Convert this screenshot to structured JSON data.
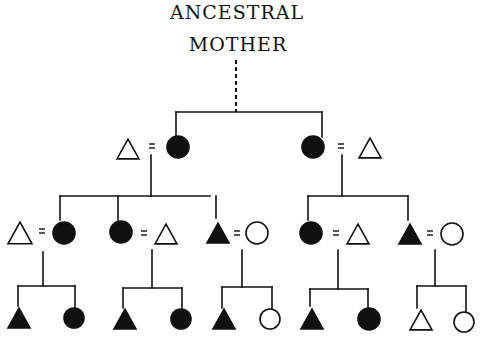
{
  "title": {
    "line1": "ANCESTRAL",
    "line2": "MOTHER"
  },
  "colors": {
    "ink": "#111111",
    "paper": "#ffffff"
  },
  "legend": {
    "triangle": "male",
    "circle": "female",
    "filled": "member of matrilineage",
    "open": "not a member of matrilineage",
    "equals": "marriage",
    "dashed": "descent from ancestral mother"
  },
  "descent_line": {
    "x": 236,
    "y1": 60,
    "y2": 112,
    "dashed": true
  },
  "lines": [
    [
      176,
      112,
      322,
      112
    ],
    [
      176,
      112,
      176,
      137
    ],
    [
      322,
      112,
      322,
      137
    ],
    [
      151,
      155,
      151,
      196
    ],
    [
      60,
      196,
      210,
      196
    ],
    [
      60,
      196,
      60,
      220
    ],
    [
      118,
      196,
      118,
      220
    ],
    [
      216,
      196,
      216,
      218
    ],
    [
      342,
      155,
      342,
      196
    ],
    [
      308,
      196,
      408,
      196
    ],
    [
      308,
      196,
      308,
      220
    ],
    [
      408,
      196,
      408,
      220
    ],
    [
      43,
      252,
      43,
      286
    ],
    [
      18,
      286,
      75,
      286
    ],
    [
      18,
      286,
      18,
      306
    ],
    [
      75,
      286,
      75,
      308
    ],
    [
      152,
      250,
      152,
      288
    ],
    [
      123,
      288,
      182,
      288
    ],
    [
      123,
      288,
      123,
      308
    ],
    [
      182,
      288,
      182,
      308
    ],
    [
      242,
      250,
      242,
      287
    ],
    [
      222,
      287,
      272,
      287
    ],
    [
      222,
      287,
      222,
      308
    ],
    [
      272,
      287,
      272,
      310
    ],
    [
      338,
      250,
      338,
      289
    ],
    [
      310,
      289,
      368,
      289
    ],
    [
      310,
      289,
      310,
      306
    ],
    [
      368,
      289,
      368,
      310
    ],
    [
      435,
      250,
      435,
      286
    ],
    [
      417,
      286,
      466,
      286
    ],
    [
      417,
      286,
      417,
      308
    ],
    [
      466,
      286,
      466,
      312
    ]
  ],
  "people": [
    {
      "id": "gen1-husband-left",
      "shape": "triangle",
      "filled": false,
      "cx": 128,
      "cy": 149,
      "size": 22
    },
    {
      "id": "gen1-daughter-left",
      "shape": "circle",
      "filled": true,
      "cx": 178,
      "cy": 147,
      "r": 11
    },
    {
      "id": "gen1-daughter-right",
      "shape": "circle",
      "filled": true,
      "cx": 313,
      "cy": 147,
      "r": 11
    },
    {
      "id": "gen1-husband-right",
      "shape": "triangle",
      "filled": false,
      "cx": 370,
      "cy": 148,
      "size": 22
    },
    {
      "id": "gen2-husband-a",
      "shape": "triangle",
      "filled": false,
      "cx": 20,
      "cy": 233,
      "size": 24
    },
    {
      "id": "gen2-daughter-a",
      "shape": "circle",
      "filled": true,
      "cx": 64,
      "cy": 233,
      "r": 11
    },
    {
      "id": "gen2-daughter-b",
      "shape": "circle",
      "filled": true,
      "cx": 121,
      "cy": 232,
      "r": 11
    },
    {
      "id": "gen2-husband-b",
      "shape": "triangle",
      "filled": false,
      "cx": 166,
      "cy": 234,
      "size": 22
    },
    {
      "id": "gen2-son-c",
      "shape": "triangle",
      "filled": true,
      "cx": 218,
      "cy": 233,
      "size": 22
    },
    {
      "id": "gen2-wife-c",
      "shape": "circle",
      "filled": false,
      "cx": 257,
      "cy": 233,
      "r": 11
    },
    {
      "id": "gen2-daughter-d",
      "shape": "circle",
      "filled": true,
      "cx": 311,
      "cy": 233,
      "r": 11
    },
    {
      "id": "gen2-husband-d",
      "shape": "triangle",
      "filled": false,
      "cx": 358,
      "cy": 234,
      "size": 22
    },
    {
      "id": "gen2-son-e",
      "shape": "triangle",
      "filled": true,
      "cx": 410,
      "cy": 234,
      "size": 22
    },
    {
      "id": "gen2-wife-e",
      "shape": "circle",
      "filled": false,
      "cx": 452,
      "cy": 234,
      "r": 11
    },
    {
      "id": "gen3-son-a",
      "shape": "triangle",
      "filled": true,
      "cx": 19,
      "cy": 318,
      "size": 22
    },
    {
      "id": "gen3-daughter-a",
      "shape": "circle",
      "filled": true,
      "cx": 74,
      "cy": 318,
      "r": 10
    },
    {
      "id": "gen3-son-b",
      "shape": "triangle",
      "filled": true,
      "cx": 125,
      "cy": 319,
      "size": 22
    },
    {
      "id": "gen3-daughter-b",
      "shape": "circle",
      "filled": true,
      "cx": 181,
      "cy": 319,
      "r": 10
    },
    {
      "id": "gen3-son-c",
      "shape": "triangle",
      "filled": true,
      "cx": 224,
      "cy": 319,
      "size": 22
    },
    {
      "id": "gen3-daughter-c",
      "shape": "circle",
      "filled": false,
      "cx": 270,
      "cy": 319,
      "r": 10
    },
    {
      "id": "gen3-son-d",
      "shape": "triangle",
      "filled": true,
      "cx": 312,
      "cy": 319,
      "size": 22
    },
    {
      "id": "gen3-daughter-d",
      "shape": "circle",
      "filled": true,
      "cx": 369,
      "cy": 319,
      "r": 11
    },
    {
      "id": "gen3-son-e",
      "shape": "triangle",
      "filled": false,
      "cx": 421,
      "cy": 320,
      "size": 22
    },
    {
      "id": "gen3-daughter-e",
      "shape": "circle",
      "filled": false,
      "cx": 464,
      "cy": 322,
      "r": 10
    }
  ],
  "marriages": [
    {
      "x": 152,
      "y": 146
    },
    {
      "x": 341,
      "y": 146
    },
    {
      "x": 42,
      "y": 231
    },
    {
      "x": 144,
      "y": 233
    },
    {
      "x": 237,
      "y": 233
    },
    {
      "x": 336,
      "y": 233
    },
    {
      "x": 430,
      "y": 233
    }
  ]
}
